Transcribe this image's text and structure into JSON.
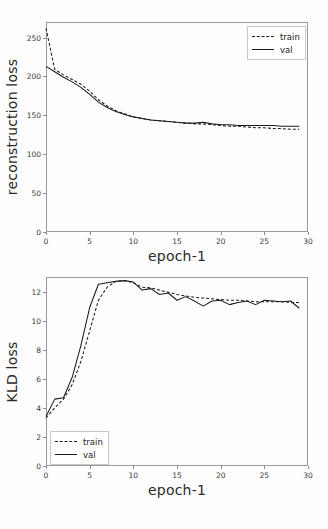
{
  "figure": {
    "background": "#fdfdfd",
    "axis_color": "#9a9a9a",
    "line_color": "#1c1c1c"
  },
  "charts": [
    {
      "id": "reconstruction-loss-chart",
      "title": "",
      "xlabel": "epoch-1",
      "ylabel": "reconstruction loss",
      "legend": [
        {
          "label": "train",
          "style": "dashed"
        },
        {
          "label": "val",
          "style": "solid"
        }
      ],
      "xticks": [
        "0",
        "5",
        "10",
        "15",
        "20",
        "25",
        "30"
      ],
      "yticks": [
        "0",
        "50",
        "100",
        "150",
        "200",
        "250"
      ]
    },
    {
      "id": "kld-loss-chart",
      "title": "",
      "xlabel": "epoch-1",
      "ylabel": "KLD loss",
      "legend": [
        {
          "label": "train",
          "style": "dashed"
        },
        {
          "label": "val",
          "style": "solid"
        }
      ],
      "xticks": [
        "0",
        "5",
        "10",
        "15",
        "20",
        "25",
        "30"
      ],
      "yticks": [
        "0",
        "2",
        "4",
        "6",
        "8",
        "10",
        "12"
      ]
    }
  ],
  "chart_data": [
    {
      "type": "line",
      "title": "",
      "xlabel": "epoch-1",
      "ylabel": "reconstruction loss",
      "xlim": [
        0,
        30
      ],
      "ylim": [
        0,
        270
      ],
      "xticks": [
        0,
        5,
        10,
        15,
        20,
        25,
        30
      ],
      "yticks": [
        0,
        50,
        100,
        150,
        200,
        250
      ],
      "grid": false,
      "legend_position": "upper right",
      "x": [
        0,
        1,
        2,
        3,
        4,
        5,
        6,
        7,
        8,
        9,
        10,
        11,
        12,
        13,
        14,
        15,
        16,
        17,
        18,
        19,
        20,
        21,
        22,
        23,
        24,
        25,
        26,
        27,
        28,
        29
      ],
      "series": [
        {
          "name": "train",
          "style": "dashed",
          "values": [
            262,
            209,
            202,
            196,
            190,
            181,
            170,
            162,
            156,
            152,
            148,
            146,
            144,
            143,
            142,
            141,
            140,
            139,
            139,
            138,
            137,
            136,
            136,
            135,
            134,
            134,
            133,
            133,
            132,
            132
          ]
        },
        {
          "name": "val",
          "style": "solid",
          "values": [
            213,
            206,
            199,
            193,
            186,
            177,
            167,
            160,
            155,
            151,
            148,
            146,
            144,
            143,
            142,
            141,
            140,
            140,
            141,
            139,
            138,
            138,
            137,
            137,
            137,
            137,
            137,
            136,
            136,
            136
          ]
        }
      ]
    },
    {
      "type": "line",
      "title": "",
      "xlabel": "epoch-1",
      "ylabel": "KLD loss",
      "xlim": [
        0,
        30
      ],
      "ylim": [
        0,
        13
      ],
      "xticks": [
        0,
        5,
        10,
        15,
        20,
        25,
        30
      ],
      "yticks": [
        0,
        2,
        4,
        6,
        8,
        10,
        12
      ],
      "grid": false,
      "legend_position": "lower left",
      "x": [
        0,
        1,
        2,
        3,
        4,
        5,
        6,
        7,
        8,
        9,
        10,
        11,
        12,
        13,
        14,
        15,
        16,
        17,
        18,
        19,
        20,
        21,
        22,
        23,
        24,
        25,
        26,
        27,
        28,
        29
      ],
      "series": [
        {
          "name": "train",
          "style": "dashed",
          "values": [
            3.3,
            4.0,
            4.6,
            5.6,
            7.2,
            9.3,
            11.4,
            12.3,
            12.7,
            12.75,
            12.6,
            12.3,
            12.25,
            12.1,
            11.95,
            11.8,
            11.7,
            11.6,
            11.55,
            11.5,
            11.45,
            11.4,
            11.4,
            11.35,
            11.3,
            11.3,
            11.3,
            11.3,
            11.25,
            11.25
          ]
        },
        {
          "name": "val",
          "style": "solid",
          "values": [
            3.4,
            4.6,
            4.7,
            6.1,
            8.3,
            10.9,
            12.5,
            12.6,
            12.7,
            12.75,
            12.65,
            12.1,
            12.2,
            11.8,
            11.9,
            11.4,
            11.65,
            11.35,
            11.0,
            11.35,
            11.4,
            11.1,
            11.25,
            11.35,
            11.1,
            11.4,
            11.35,
            11.3,
            11.35,
            10.85
          ]
        }
      ]
    }
  ]
}
